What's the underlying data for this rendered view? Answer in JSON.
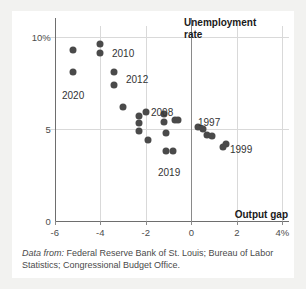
{
  "chart_data": {
    "type": "scatter",
    "title": "",
    "xlabel": "Output gap",
    "ylabel": "Unemployment rate",
    "xlim": [
      -6.4,
      4.3
    ],
    "ylim": [
      0,
      10.6
    ],
    "xticks": [
      -6,
      -4,
      -2,
      0,
      2,
      4
    ],
    "xticklabels": [
      "-6",
      "-4",
      "-2",
      "0",
      "2",
      "4%"
    ],
    "yticks": [
      0,
      5,
      10
    ],
    "yticklabels": [
      "0",
      "5",
      "10%"
    ],
    "grid": "both",
    "legend": "none",
    "series": [
      {
        "name": "US years",
        "marker_color": "#4a4a4a",
        "points": [
          {
            "x": -5.2,
            "y": 9.3,
            "label": ""
          },
          {
            "x": -5.2,
            "y": 8.1,
            "label": "2020"
          },
          {
            "x": -4.0,
            "y": 9.6,
            "label": "2010"
          },
          {
            "x": -4.0,
            "y": 9.1,
            "label": ""
          },
          {
            "x": -3.4,
            "y": 8.1,
            "label": "2012"
          },
          {
            "x": -3.4,
            "y": 7.4,
            "label": ""
          },
          {
            "x": -3.0,
            "y": 6.2,
            "label": ""
          },
          {
            "x": -2.3,
            "y": 5.7,
            "label": ""
          },
          {
            "x": -2.3,
            "y": 5.3,
            "label": ""
          },
          {
            "x": -2.3,
            "y": 4.9,
            "label": ""
          },
          {
            "x": -2.0,
            "y": 5.9,
            "label": ""
          },
          {
            "x": -1.9,
            "y": 4.4,
            "label": ""
          },
          {
            "x": -1.2,
            "y": 5.8,
            "label": "2008"
          },
          {
            "x": -1.2,
            "y": 5.4,
            "label": ""
          },
          {
            "x": -1.1,
            "y": 4.8,
            "label": ""
          },
          {
            "x": -1.1,
            "y": 3.8,
            "label": "2019"
          },
          {
            "x": -0.8,
            "y": 3.8,
            "label": ""
          },
          {
            "x": -0.7,
            "y": 5.5,
            "label": ""
          },
          {
            "x": -0.6,
            "y": 5.5,
            "label": ""
          },
          {
            "x": 0.3,
            "y": 5.1,
            "label": "1997"
          },
          {
            "x": 0.5,
            "y": 5.0,
            "label": ""
          },
          {
            "x": 0.7,
            "y": 4.7,
            "label": ""
          },
          {
            "x": 0.9,
            "y": 4.6,
            "label": ""
          },
          {
            "x": 1.5,
            "y": 4.2,
            "label": "1999"
          },
          {
            "x": 1.4,
            "y": 4.0,
            "label": ""
          }
        ]
      }
    ],
    "annotations": [
      {
        "text": "2010",
        "x_px": 100,
        "y_px": 37
      },
      {
        "text": "2012",
        "x_px": 114,
        "y_px": 63
      },
      {
        "text": "2020",
        "x_px": 50,
        "y_px": 79
      },
      {
        "text": "2008",
        "x_px": 139,
        "y_px": 96
      },
      {
        "text": "2019",
        "x_px": 146,
        "y_px": 156
      },
      {
        "text": "1997",
        "x_px": 186,
        "y_px": 106
      },
      {
        "text": "1999",
        "x_px": 218,
        "y_px": 133
      }
    ]
  },
  "axis_titles": {
    "y_line1": "Unemployment",
    "y_line2": "rate",
    "x_title": "Output gap"
  },
  "caption": {
    "lead": "Data from:",
    "text": " Federal Reserve Bank of St. Louis; Bureau of Labor Statistics; Congressional Budget Office."
  },
  "colors": {
    "marker": "#4a4a4a",
    "grid": "#d9d9d9",
    "axis": "#6e6e6e",
    "background": "#ffffff",
    "page": "#f2f2f0",
    "text": "#333333"
  }
}
